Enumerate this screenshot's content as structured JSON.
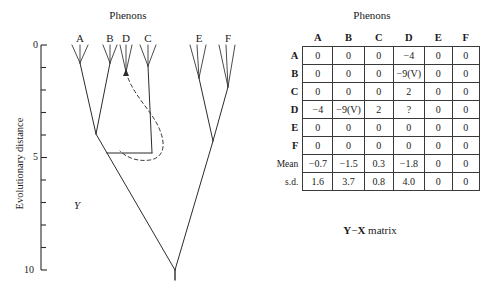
{
  "tree": {
    "title": "Phenons",
    "y_axis_label": "Evolutionary distance",
    "y_ticks": [
      {
        "value": "0",
        "y": 45
      },
      {
        "value": "",
        "y": 67.5
      },
      {
        "value": "",
        "y": 90
      },
      {
        "value": "",
        "y": 112.5
      },
      {
        "value": "",
        "y": 135
      },
      {
        "value": "5",
        "y": 157.5
      },
      {
        "value": "",
        "y": 180
      },
      {
        "value": "",
        "y": 202.5
      },
      {
        "value": "",
        "y": 225
      },
      {
        "value": "",
        "y": 247.5
      },
      {
        "value": "10",
        "y": 270
      }
    ],
    "y_min": 0,
    "y_max": 10,
    "leaves": [
      {
        "label": "A",
        "x": 80
      },
      {
        "label": "B",
        "x": 110
      },
      {
        "label": "D",
        "x": 126
      },
      {
        "label": "C",
        "x": 148
      },
      {
        "label": "E",
        "x": 199
      },
      {
        "label": "F",
        "x": 228
      }
    ],
    "marker_label": "Y"
  },
  "matrix": {
    "title": "Phenons",
    "caption_prefix": "Y",
    "caption_middle": "−",
    "caption_suffix": "X",
    "caption_word": "matrix",
    "columns": [
      "A",
      "B",
      "C",
      "D",
      "E",
      "F"
    ],
    "rows": [
      {
        "label": "A",
        "values": [
          "0",
          "0",
          "0",
          "−4",
          "0",
          "0"
        ]
      },
      {
        "label": "B",
        "values": [
          "0",
          "0",
          "0",
          "−9(V)",
          "0",
          "0"
        ]
      },
      {
        "label": "C",
        "values": [
          "0",
          "0",
          "0",
          "2",
          "0",
          "0"
        ]
      },
      {
        "label": "D",
        "values": [
          "−4",
          "−9(V)",
          "2",
          "?",
          "0",
          "0"
        ]
      },
      {
        "label": "E",
        "values": [
          "0",
          "0",
          "0",
          "0",
          "0",
          "0"
        ]
      },
      {
        "label": "F",
        "values": [
          "0",
          "0",
          "0",
          "0",
          "0",
          "0"
        ]
      },
      {
        "label": "Mean",
        "values": [
          "−0.7",
          "−1.5",
          "0.3",
          "−1.8",
          "0",
          "0"
        ]
      },
      {
        "label": "s.d.",
        "values": [
          "1.6",
          "3.7",
          "0.8",
          "4.0",
          "0",
          "0"
        ]
      }
    ]
  },
  "colors": {
    "ink": "#1a1a1a",
    "line": "#2b2b2b",
    "grid": "#3a3a3a",
    "background": "#ffffff"
  }
}
